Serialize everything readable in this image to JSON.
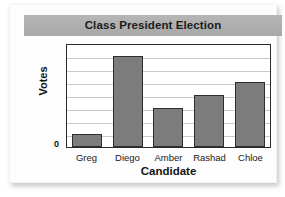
{
  "card": {
    "background_color": "#fdfdfd"
  },
  "title_band": {
    "background_color": "#aeaeae",
    "title": "Class President Election"
  },
  "axis": {
    "zero_label": "0",
    "y_title": "Votes",
    "x_title": "Candidate"
  },
  "chart_data": {
    "type": "bar",
    "title": "Class President Election",
    "xlabel": "Candidate",
    "ylabel": "Votes",
    "categories": [
      "Greg",
      "Diego",
      "Amber",
      "Rashad",
      "Chloe"
    ],
    "values": [
      1,
      7,
      3,
      4,
      5
    ],
    "ylim": [
      0,
      8
    ],
    "yticks": [
      0,
      1,
      2,
      3,
      4,
      5,
      6,
      7,
      8
    ],
    "ytick_labels": [
      "0",
      "",
      "",
      "",
      "",
      "",
      "",
      "",
      ""
    ],
    "gridlines": 7,
    "grid": true,
    "legend": "none",
    "bar_color": "#7c7c7c",
    "bar_edge_color": "#2e2e2e"
  }
}
